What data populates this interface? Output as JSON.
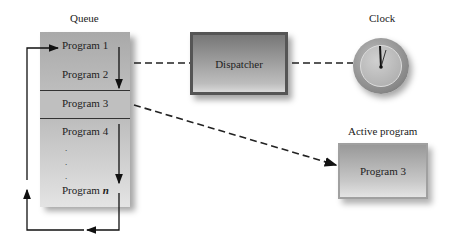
{
  "diagram": {
    "queue": {
      "title": "Queue",
      "items": [
        "Program 1",
        "Program 2",
        "Program 3",
        "Program 4",
        ".",
        ".",
        ".",
        "Program n"
      ],
      "program_n_prefix": "Program ",
      "program_n_var": "n"
    },
    "dispatcher": {
      "label": "Dispatcher"
    },
    "clock": {
      "title": "Clock"
    },
    "active": {
      "title": "Active program",
      "program": "Program 3"
    },
    "connections": [
      {
        "from": "queue.Program 2",
        "to": "dispatcher",
        "style": "dashed"
      },
      {
        "from": "dispatcher",
        "to": "clock",
        "style": "dashed"
      },
      {
        "from": "queue.Program 3",
        "to": "active",
        "style": "dashed-arrow"
      },
      {
        "from": "queue.bottom",
        "to": "queue.top",
        "style": "solid-loop-arrow"
      }
    ]
  }
}
